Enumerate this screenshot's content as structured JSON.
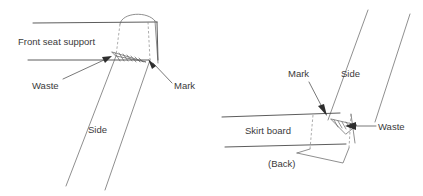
{
  "figure": {
    "background_color": "#ffffff",
    "line_color": "#4a4a4a",
    "text_color": "#3a3a3a"
  },
  "left_diagram": {
    "name": "front-seat-support-joint",
    "labels": {
      "front_seat_support": "Front seat support",
      "waste": "Waste",
      "mark": "Mark",
      "side": "Side"
    }
  },
  "right_diagram": {
    "name": "skirt-board-joint",
    "labels": {
      "side": "Side",
      "mark": "Mark",
      "skirt_board": "Skirt board",
      "waste": "Waste",
      "back": "(Back)"
    }
  }
}
